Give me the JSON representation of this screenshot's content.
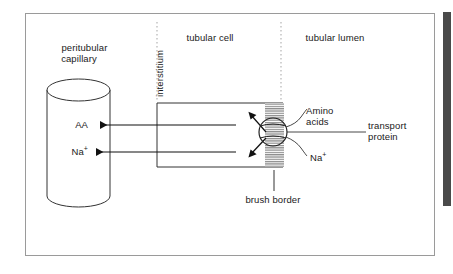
{
  "figure": {
    "type": "biology-diagram",
    "compartments": {
      "capillary": "peritubular\ncapillary",
      "interstitium": "interstitium",
      "cell": "tubular cell",
      "lumen": "tubular lumen"
    },
    "transported": {
      "amino_acids_left": "AA",
      "sodium_left": "Na",
      "sodium_left_charge": "+",
      "amino_acids_right_line1": "Amino",
      "amino_acids_right_line2": "acids",
      "sodium_right": "Na",
      "sodium_right_charge": "+"
    },
    "structures": {
      "transport_protein_line1": "transport",
      "transport_protein_line2": "protein",
      "brush_border": "brush border"
    },
    "colors": {
      "frame_border": "#9a9a9a",
      "ink": "#1a1a1a",
      "divider_dotted": "#b4b4b4",
      "side_bar": "#4a4a4a",
      "background": "#ffffff"
    }
  }
}
